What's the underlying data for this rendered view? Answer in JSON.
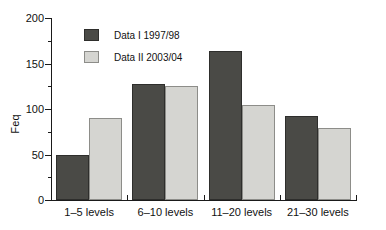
{
  "chart_data": {
    "type": "bar",
    "title": "",
    "xlabel": "",
    "ylabel": "Feq",
    "ylim": [
      0,
      200
    ],
    "yticks": [
      0,
      50,
      100,
      150,
      200
    ],
    "ytick_labels": [
      "0",
      "50",
      "100",
      "150",
      "200"
    ],
    "minor_ticks": [
      25,
      75,
      125,
      175
    ],
    "grid": false,
    "legend_position": "upper-left-inside",
    "categories": [
      "1–5 levels",
      "6–10 levels",
      "11–20 levels",
      "21–30 levels"
    ],
    "series": [
      {
        "name": "Data I 1997/98",
        "color": "#4a4a46",
        "values": [
          50,
          128,
          164,
          92
        ]
      },
      {
        "name": "Data II 2003/04",
        "color": "#d5d5d1",
        "values": [
          90,
          125,
          104,
          79
        ]
      }
    ]
  },
  "legend": {
    "items": [
      {
        "label": "Data I 1997/98",
        "swatch": "dark-swatch"
      },
      {
        "label": "Data II 2003/04",
        "swatch": "light-swatch"
      }
    ]
  },
  "axes": {
    "y_title": "Feq"
  }
}
